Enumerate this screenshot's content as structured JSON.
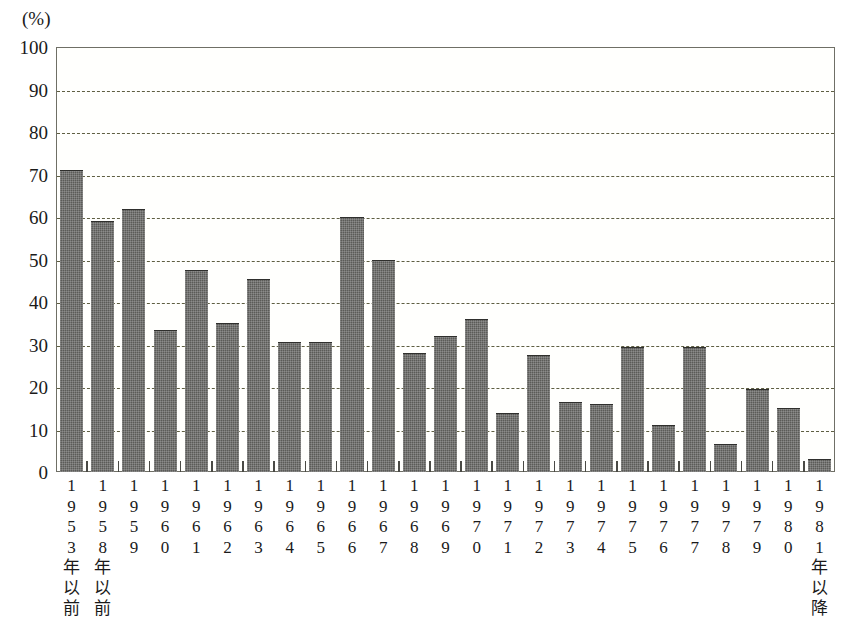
{
  "chart_data": {
    "type": "bar",
    "title": "",
    "subtitle": "",
    "xlabel": "",
    "ylabel": "",
    "unit_label": "(%)",
    "ylim": [
      0,
      100
    ],
    "yticks": [
      0,
      10,
      20,
      30,
      40,
      50,
      60,
      70,
      80,
      90,
      100
    ],
    "ytick_labels": [
      "0",
      "10",
      "20",
      "30",
      "40",
      "50",
      "60",
      "70",
      "80",
      "90",
      "100"
    ],
    "grid": true,
    "grid_style": "dashed",
    "legend": null,
    "bar_color": "#5b5b58",
    "grid_color": "#5e5e42",
    "axis_color": "#6f6f66",
    "categories": [
      "1953年以前",
      "1958年以前",
      "1959",
      "1960",
      "1961",
      "1962",
      "1963",
      "1964",
      "1965",
      "1966",
      "1967",
      "1968",
      "1969",
      "1970",
      "1971",
      "1972",
      "1973",
      "1974",
      "1975",
      "1976",
      "1977",
      "1978",
      "1979",
      "1980",
      "1981年以降"
    ],
    "category_lines": [
      [
        "1",
        "9",
        "5",
        "3",
        "年",
        "以",
        "前"
      ],
      [
        "1",
        "9",
        "5",
        "8",
        "年",
        "以",
        "前"
      ],
      [
        "1",
        "9",
        "5",
        "9"
      ],
      [
        "1",
        "9",
        "6",
        "0"
      ],
      [
        "1",
        "9",
        "6",
        "1"
      ],
      [
        "1",
        "9",
        "6",
        "2"
      ],
      [
        "1",
        "9",
        "6",
        "3"
      ],
      [
        "1",
        "9",
        "6",
        "4"
      ],
      [
        "1",
        "9",
        "6",
        "5"
      ],
      [
        "1",
        "9",
        "6",
        "6"
      ],
      [
        "1",
        "9",
        "6",
        "7"
      ],
      [
        "1",
        "9",
        "6",
        "8"
      ],
      [
        "1",
        "9",
        "6",
        "9"
      ],
      [
        "1",
        "9",
        "7",
        "0"
      ],
      [
        "1",
        "9",
        "7",
        "1"
      ],
      [
        "1",
        "9",
        "7",
        "2"
      ],
      [
        "1",
        "9",
        "7",
        "3"
      ],
      [
        "1",
        "9",
        "7",
        "4"
      ],
      [
        "1",
        "9",
        "7",
        "5"
      ],
      [
        "1",
        "9",
        "7",
        "6"
      ],
      [
        "1",
        "9",
        "7",
        "7"
      ],
      [
        "1",
        "9",
        "7",
        "8"
      ],
      [
        "1",
        "9",
        "7",
        "9"
      ],
      [
        "1",
        "9",
        "8",
        "0"
      ],
      [
        "1",
        "9",
        "8",
        "1",
        "年",
        "以",
        "降"
      ]
    ],
    "values": [
      71.0,
      59.0,
      62.0,
      33.5,
      47.5,
      35.0,
      45.5,
      30.5,
      30.5,
      60.0,
      50.0,
      28.0,
      32.0,
      36.0,
      14.0,
      27.5,
      16.5,
      16.0,
      29.5,
      11.0,
      29.5,
      6.5,
      19.5,
      15.0,
      3.0
    ]
  }
}
